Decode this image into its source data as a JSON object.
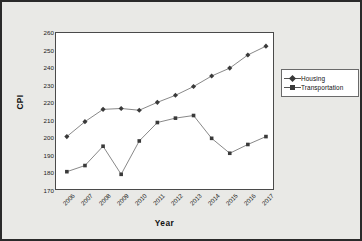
{
  "chart_data": {
    "type": "line",
    "title": "",
    "xlabel": "Year",
    "ylabel": "CPI",
    "categories": [
      "2006",
      "2007",
      "2008",
      "2009",
      "2010",
      "2011",
      "2012",
      "2013",
      "2014",
      "2015",
      "2016",
      "2017"
    ],
    "ylim": [
      170,
      260
    ],
    "yticks": [
      170,
      180,
      190,
      200,
      210,
      220,
      230,
      240,
      250,
      260
    ],
    "grid": false,
    "legend_position": "right",
    "series": [
      {
        "name": "Housing",
        "marker": "diamond",
        "color": "#3a3a3a",
        "values": [
          201,
          209.5,
          216.5,
          217,
          216,
          220.5,
          224.5,
          229.5,
          235.5,
          240,
          247.5,
          252.5
        ]
      },
      {
        "name": "Transportation",
        "marker": "square",
        "color": "#3a3a3a",
        "values": [
          181,
          184.5,
          195.5,
          179.5,
          198.5,
          209,
          211.5,
          213,
          200,
          191.5,
          196.5,
          201
        ]
      }
    ]
  },
  "legend": {
    "items": [
      {
        "label": "Housing"
      },
      {
        "label": "Transportation"
      }
    ]
  },
  "axes": {
    "y_title": "CPI",
    "x_title": "Year"
  }
}
